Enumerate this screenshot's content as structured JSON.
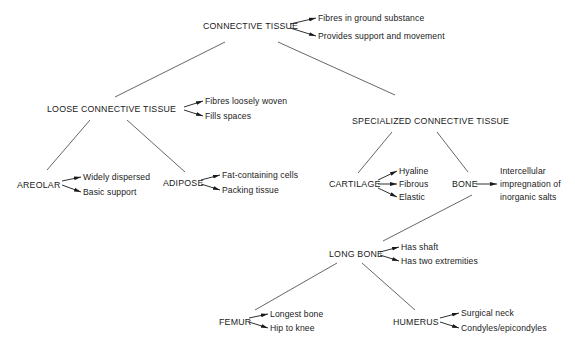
{
  "diagram": {
    "root": {
      "label": "CONNECTIVE TISSUE",
      "notes": [
        "Fibres in ground substance",
        "Provides support and movement"
      ]
    },
    "loose": {
      "label": "LOOSE CONNECTIVE TISSUE",
      "notes": [
        "Fibres loosely woven",
        "Fills spaces"
      ]
    },
    "specialized": {
      "label": "SPECIALIZED CONNECTIVE TISSUE"
    },
    "areolar": {
      "label": "AREOLAR",
      "notes": [
        "Widely dispersed",
        "Basic support"
      ]
    },
    "adipose": {
      "label": "ADIPOSE",
      "notes": [
        "Fat-containing cells",
        "Packing tissue"
      ]
    },
    "cartilage": {
      "label": "CARTILAGE",
      "notes": [
        "Hyaline",
        "Fibrous",
        "Elastic"
      ]
    },
    "bone": {
      "label": "BONE",
      "notes": [
        "Intercellular",
        "impregnation of",
        "inorganic salts"
      ]
    },
    "long_bone": {
      "label": "LONG BONE",
      "notes": [
        "Has shaft",
        "Has two extremities"
      ]
    },
    "femur": {
      "label": "FEMUR",
      "notes": [
        "Longest bone",
        "Hip to knee"
      ]
    },
    "humerus": {
      "label": "HUMERUS",
      "notes": [
        "Surgical neck",
        "Condyles/epicondyles"
      ]
    }
  }
}
